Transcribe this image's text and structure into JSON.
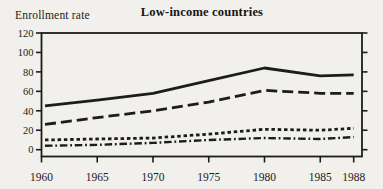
{
  "figure": {
    "title": "Low-income countries",
    "ylabel": "Enrollment rate"
  },
  "colors": {
    "ink": "#1c1c1c",
    "paper": "#f1f0ec"
  },
  "chart_data": {
    "type": "line",
    "title": "Low-income countries",
    "xlabel": "",
    "ylabel": "Enrollment rate",
    "x": [
      1960,
      1965,
      1970,
      1975,
      1980,
      1985,
      1988
    ],
    "xtick_labels": [
      "1960",
      "1965",
      "1970",
      "1975",
      "1980",
      "1985",
      "1988"
    ],
    "yticks": [
      0,
      20,
      40,
      60,
      80,
      100,
      120
    ],
    "ylim": [
      -7,
      120
    ],
    "xlim": [
      1960,
      1988.8
    ],
    "grid": false,
    "legend": "none",
    "frame": "box-with-mirrored-y-ticks",
    "series": [
      {
        "name": "solid-line",
        "style": "solid",
        "values": [
          45,
          51,
          58,
          71,
          84,
          76,
          77
        ]
      },
      {
        "name": "long-dash-line",
        "style": "long-dash",
        "values": [
          26,
          33,
          40,
          49,
          61,
          58,
          58
        ]
      },
      {
        "name": "short-dash-line",
        "style": "short-dash",
        "values": [
          10,
          11,
          12,
          16,
          21,
          20,
          22
        ]
      },
      {
        "name": "dash-dot-line",
        "style": "dash-dot",
        "values": [
          4,
          5,
          7,
          10,
          12,
          11,
          13
        ]
      }
    ]
  }
}
